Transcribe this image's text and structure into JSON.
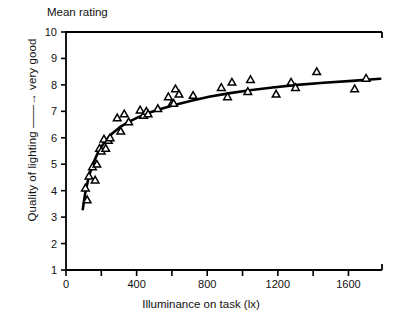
{
  "chart_data": {
    "type": "scatter",
    "title": "Mean rating",
    "xlabel": "Illuminance on task (lx)",
    "ylabel": "Quality of lighting ——→ very good",
    "ylabel_parts": {
      "prefix": "Quality of lighting",
      "arrow": "——→",
      "suffix": "very good"
    },
    "xlim": [
      0,
      1790
    ],
    "ylim": [
      1,
      10
    ],
    "xticks": [
      0,
      400,
      800,
      1200,
      1600
    ],
    "xtick_labels": [
      "0",
      "400",
      "800",
      "1200",
      "1600"
    ],
    "xminor_ticks": [
      200,
      600,
      1000,
      1400,
      1800
    ],
    "yticks": [
      1,
      2,
      3,
      4,
      5,
      6,
      7,
      8,
      9,
      10
    ],
    "ytick_labels": [
      "1",
      "2",
      "3",
      "4",
      "5",
      "6",
      "7",
      "8",
      "9",
      "10"
    ],
    "grid": false,
    "legend": null,
    "marker": "open-triangle",
    "series": [
      {
        "name": "Mean rating vs illuminance",
        "x": [
          110,
          120,
          130,
          150,
          165,
          175,
          190,
          200,
          215,
          225,
          240,
          250,
          290,
          310,
          330,
          355,
          420,
          440,
          455,
          465,
          520,
          580,
          600,
          610,
          620,
          640,
          720,
          880,
          915,
          940,
          1030,
          1045,
          1190,
          1275,
          1300,
          1420,
          1635,
          1700
        ],
        "y": [
          4.1,
          3.65,
          4.55,
          4.9,
          4.4,
          5.0,
          5.6,
          5.5,
          5.95,
          5.6,
          5.9,
          6.0,
          6.75,
          6.25,
          6.9,
          6.6,
          7.05,
          6.85,
          7.0,
          6.9,
          7.1,
          7.55,
          7.3,
          7.3,
          7.85,
          7.65,
          7.6,
          7.9,
          7.55,
          8.1,
          7.75,
          8.2,
          7.65,
          8.1,
          7.9,
          8.5,
          7.85,
          8.25
        ]
      }
    ],
    "fit_curve": {
      "name": "fitted curve",
      "x": [
        95,
        110,
        130,
        155,
        185,
        220,
        260,
        305,
        355,
        410,
        470,
        540,
        620,
        710,
        810,
        920,
        1040,
        1170,
        1310,
        1460,
        1620,
        1780
      ],
      "y": [
        3.3,
        3.95,
        4.55,
        5.05,
        5.5,
        5.85,
        6.15,
        6.4,
        6.6,
        6.78,
        6.95,
        7.1,
        7.25,
        7.4,
        7.55,
        7.68,
        7.8,
        7.9,
        8.0,
        8.08,
        8.15,
        8.23
      ]
    }
  }
}
